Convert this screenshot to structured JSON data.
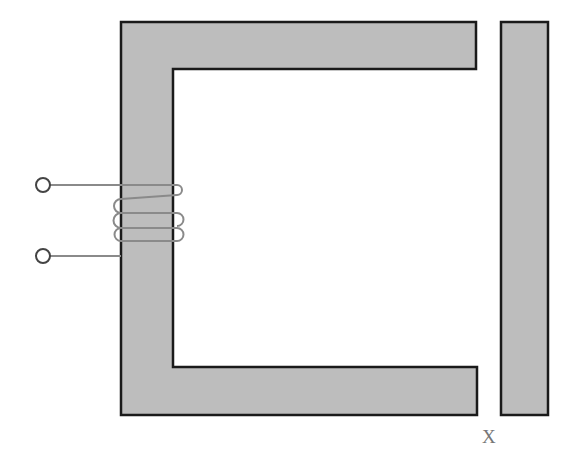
{
  "diagram": {
    "type": "electromagnet-with-armature",
    "core_fill": "#bdbdbd",
    "stroke": "#1a1a1a",
    "wire_color": "#8a8a8a",
    "gap_label": "X",
    "components": [
      "C-shaped core",
      "coil winding (3 turns)",
      "two terminals",
      "movable armature bar"
    ]
  }
}
